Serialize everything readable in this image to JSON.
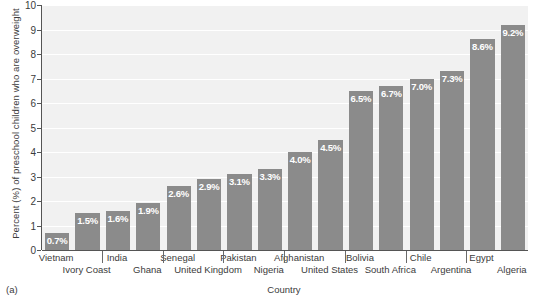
{
  "chart_data": {
    "type": "bar",
    "title": "",
    "xlabel": "Country",
    "ylabel": "Percent (%) of preschool children who are overweight",
    "ylim": [
      0,
      10
    ],
    "ytick_labels": [
      "0",
      "1",
      "2",
      "3",
      "4",
      "5",
      "6",
      "7",
      "8",
      "9",
      "10"
    ],
    "grid": true,
    "legend": "none",
    "categories": [
      "Vietnam",
      "Ivory Coast",
      "India",
      "Ghana",
      "Senegal",
      "United Kingdom",
      "Pakistan",
      "Nigeria",
      "Afghanistan",
      "United States",
      "Bolivia",
      "South Africa",
      "Chile",
      "Argentina",
      "Egypt",
      "Algeria"
    ],
    "values": [
      0.7,
      1.5,
      1.6,
      1.9,
      2.6,
      2.9,
      3.1,
      3.3,
      4.0,
      4.5,
      6.5,
      6.7,
      7.0,
      7.3,
      8.6,
      9.2
    ],
    "value_labels": [
      "0.7%",
      "1.5%",
      "1.6%",
      "1.9%",
      "2.6%",
      "2.9%",
      "3.1%",
      "3.3%",
      "4.0%",
      "4.5%",
      "6.5%",
      "6.7%",
      "7.0%",
      "7.3%",
      "8.6%",
      "9.2%"
    ],
    "bar_color": "#8b8b8b",
    "plot_background": "#f1f1f1",
    "value_label_color": "#ffffff"
  },
  "figure": {
    "panel_letter": "(a)",
    "caption_sliver": ""
  }
}
